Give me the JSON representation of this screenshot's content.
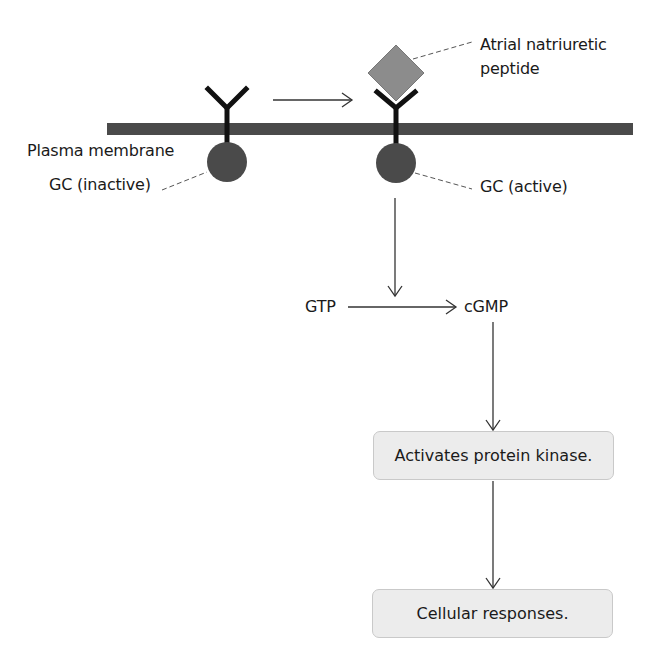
{
  "labels": {
    "plasma_membrane": "Plasma membrane",
    "gc_inactive": "GC (inactive)",
    "gc_active": "GC (active)",
    "anp_line1": "Atrial natriuretic",
    "anp_line2": "peptide",
    "gtp": "GTP",
    "cgmp": "cGMP"
  },
  "boxes": {
    "protein_kinase": "Activates protein kinase.",
    "cellular_responses": "Cellular responses."
  },
  "colors": {
    "membrane": "#4a4a4a",
    "gc_enzyme": "#4a4a4a",
    "receptor": "#111111",
    "anp_diamond": "#8c8c8c",
    "box_fill": "#ececec",
    "arrow": "#333333"
  }
}
